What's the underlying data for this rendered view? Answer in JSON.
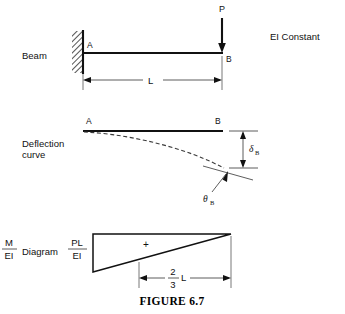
{
  "figure": {
    "caption": "FIGURE 6.7",
    "note": "EI Constant"
  },
  "panels": [
    {
      "id": "beam",
      "label": "Beam",
      "points": {
        "left": "A",
        "right": "B"
      },
      "load": "P",
      "dimension": "L"
    },
    {
      "id": "deflection",
      "label_line1": "Deflection",
      "label_line2": "curve",
      "points": {
        "left": "A",
        "right": "B"
      },
      "deflection_symbol": "δ",
      "deflection_subscript": "B",
      "slope_symbol": "θ",
      "slope_subscript": "B"
    },
    {
      "id": "moment",
      "label_numerator": "M",
      "label_denominator": "EI",
      "label_word": "Diagram",
      "peak_numerator": "PL",
      "peak_denominator": "EI",
      "sign": "+",
      "centroid_numerator": "2",
      "centroid_denominator": "3",
      "centroid_unit": "L"
    }
  ],
  "icons": {
    "fixed_support": "fixed-support-hatching-icon",
    "load_arrow": "downward-load-arrow-icon",
    "dimension_arrow": "dimension-arrow-icon",
    "leader_arrow": "leader-arrow-icon"
  }
}
